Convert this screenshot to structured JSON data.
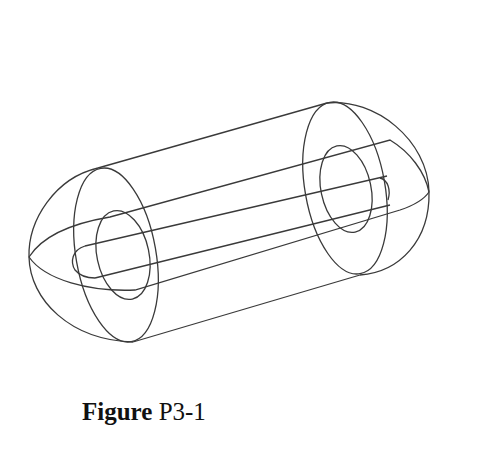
{
  "figure": {
    "caption_bold": "Figure",
    "caption_rest": " P3-1",
    "stroke_color": "#3a3a3a",
    "background": "#ffffff"
  }
}
